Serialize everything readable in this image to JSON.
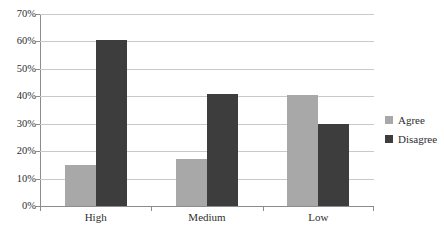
{
  "chart_data": {
    "type": "bar",
    "title": "",
    "xlabel": "",
    "ylabel": "",
    "categories": [
      "High",
      "Medium",
      "Low"
    ],
    "series": [
      {
        "name": "Agree",
        "color": "#a8a8a8",
        "values": [
          15,
          17,
          40.5
        ]
      },
      {
        "name": "Disagree",
        "color": "#3d3d3d",
        "values": [
          60.5,
          41,
          30
        ]
      }
    ],
    "ylim": [
      0,
      70
    ],
    "ytick_step": 10,
    "ytick_labels": [
      "0%",
      "10%",
      "20%",
      "30%",
      "40%",
      "50%",
      "60%",
      "70%"
    ],
    "ytick_values": [
      0,
      10,
      20,
      30,
      40,
      50,
      60,
      70
    ],
    "grid": "horizontal",
    "legend_position": "right"
  },
  "legend": {
    "entries": [
      {
        "label": "Agree"
      },
      {
        "label": "Disagree"
      }
    ]
  },
  "colors": {
    "agree": "#a8a8a8",
    "disagree": "#3d3d3d",
    "gridline": "#c9c9c9",
    "axis": "#8c8c8c",
    "text": "#2e2e2e",
    "background": "#ffffff"
  }
}
